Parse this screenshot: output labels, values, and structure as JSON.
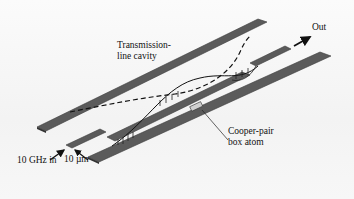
{
  "diagram": {
    "labels": {
      "cavity_line1": "Transmission-",
      "cavity_line2": "line cavity",
      "out": "Out",
      "atom_line1": "Cooper-pair",
      "atom_line2": "box atom",
      "input": "10 GHz in",
      "gap": "10 µm"
    },
    "colors": {
      "strip": "#5a5a5a",
      "strip_edge": "#3a3a3a",
      "text": "#111111",
      "background": "#f6f6f6"
    }
  }
}
